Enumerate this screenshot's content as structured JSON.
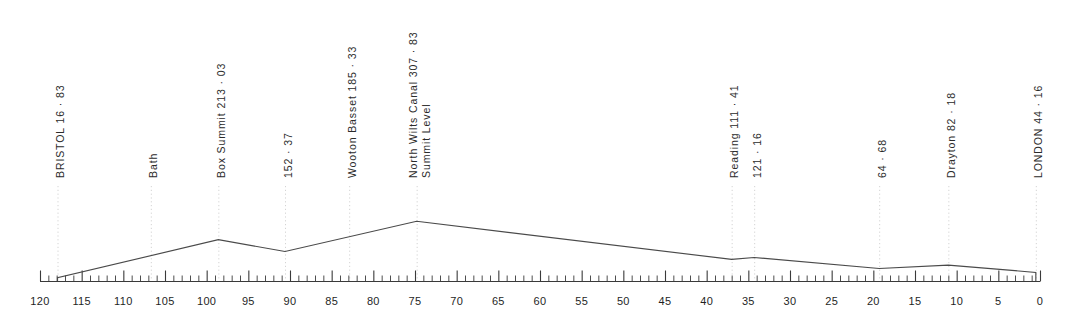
{
  "figure": {
    "colors": {
      "profile_line": "#4a4a4a",
      "axis_line": "#3a3a3a",
      "tick": "#3a3a3a",
      "dotted_leader": "#cfcfcf",
      "text": "#2b2b2b",
      "background": "#ffffff"
    }
  },
  "chart_data": {
    "type": "line",
    "title": "",
    "xlabel": "",
    "ylabel": "",
    "xlim": [
      120,
      0
    ],
    "ylim": [
      0,
      330
    ],
    "grid": false,
    "legend": null,
    "axis": {
      "orientation": "horizontal-bottom",
      "direction": "decreasing-left-to-right",
      "minor_tick_interval": 1,
      "major_tick_interval": 5,
      "tick_labels": [
        "120",
        "115",
        "110",
        "105",
        "100",
        "95",
        "90",
        "85",
        "80",
        "75",
        "70",
        "65",
        "60",
        "55",
        "50",
        "45",
        "40",
        "35",
        "30",
        "25",
        "20",
        "15",
        "10",
        "5",
        "0"
      ],
      "tick_values": [
        120,
        115,
        110,
        105,
        100,
        95,
        90,
        85,
        80,
        75,
        70,
        65,
        60,
        55,
        50,
        45,
        40,
        35,
        30,
        25,
        20,
        15,
        10,
        5,
        0
      ]
    },
    "series": [
      {
        "name": "Elevation profile",
        "points": [
          {
            "x": 117.9,
            "y": 0
          },
          {
            "x": 117.9,
            "y": 16.83
          },
          {
            "x": 98.6,
            "y": 213.03
          },
          {
            "x": 90.6,
            "y": 152.37
          },
          {
            "x": 74.8,
            "y": 307.83
          },
          {
            "x": 37.0,
            "y": 111.41
          },
          {
            "x": 34.3,
            "y": 121.16
          },
          {
            "x": 19.3,
            "y": 64.68
          },
          {
            "x": 11.0,
            "y": 82.18
          },
          {
            "x": 0.5,
            "y": 44.16
          },
          {
            "x": 0.5,
            "y": 0
          }
        ]
      }
    ],
    "annotations": [
      {
        "id": "bristol",
        "x": 117.9,
        "value": 16.83,
        "text": "BRISTOL  16 · 83",
        "line2": ""
      },
      {
        "id": "bath",
        "x": 106.7,
        "value": null,
        "text": "Bath",
        "line2": ""
      },
      {
        "id": "box-summit",
        "x": 98.6,
        "value": 213.03,
        "text": "Box Summit  213 · 03",
        "line2": ""
      },
      {
        "id": "point-152-37",
        "x": 90.6,
        "value": 152.37,
        "text": "152 · 37",
        "line2": ""
      },
      {
        "id": "wooton-basset",
        "x": 82.9,
        "value": 185.33,
        "text": "Wooton Basset  185 · 33",
        "line2": ""
      },
      {
        "id": "north-wilts-canal",
        "x": 74.8,
        "value": 307.83,
        "text": "North  Wilts  Canal   307 · 83",
        "line2": "Summit  Level"
      },
      {
        "id": "reading",
        "x": 37.0,
        "value": 111.41,
        "text": "Reading  111 · 41",
        "line2": ""
      },
      {
        "id": "point-121-16",
        "x": 34.3,
        "value": 121.16,
        "text": "121 · 16",
        "line2": ""
      },
      {
        "id": "point-64-68",
        "x": 19.3,
        "value": 64.68,
        "text": "64 · 68",
        "line2": ""
      },
      {
        "id": "drayton",
        "x": 11.0,
        "value": 82.18,
        "text": "Drayton  82 · 18",
        "line2": ""
      },
      {
        "id": "london",
        "x": 0.5,
        "value": 44.16,
        "text": "LONDON  44 · 16",
        "line2": ""
      }
    ]
  },
  "layout": {
    "axis_y": 281,
    "axis_x_start": 40,
    "axis_x_end": 1040,
    "px_per_unit": 8.27,
    "label_bottom_y": 178,
    "leader_top_y": 186
  }
}
